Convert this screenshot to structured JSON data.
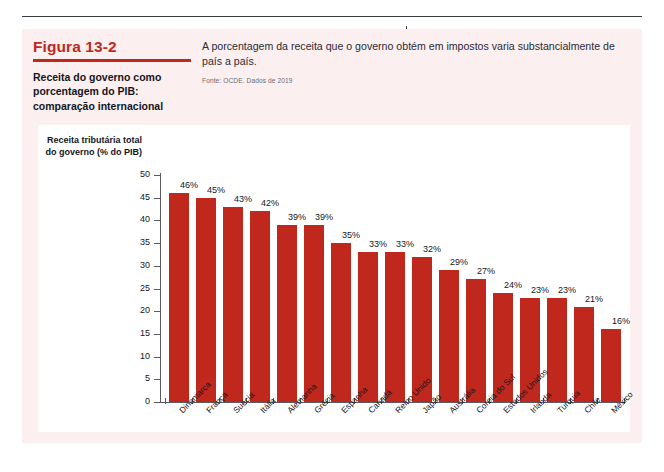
{
  "figure": {
    "number": "Figura 13-2",
    "subtitle": "Receita do governo como porcentagem do PIB: comparação internacional",
    "description": "A porcentagem da receita que o governo obtém em impostos varia substancialmente de país a país.",
    "source": "Fonte: OCDE. Dados de 2019"
  },
  "colors": {
    "bar": "#C0281E",
    "accent": "#C0281E",
    "panel": "#FBEFF0",
    "axis": "#5A5A62",
    "text": "#16161C"
  },
  "chart_data": {
    "type": "bar",
    "title": "Receita do governo como porcentagem do PIB: comparação internacional",
    "xlabel": "",
    "ylabel": "Receita tributária total do governo (% do PIB)",
    "ylim": [
      0,
      50
    ],
    "ytick_step": 5,
    "yticks": [
      50,
      45,
      40,
      35,
      30,
      25,
      20,
      15,
      10,
      5,
      0
    ],
    "grid": false,
    "legend": false,
    "value_suffix": "%",
    "categories": [
      "Dinamarca",
      "França",
      "Suécia",
      "Itália",
      "Alemanha",
      "Grécia",
      "Espanha",
      "Canadá",
      "Reino Unido",
      "Japão",
      "Austrália",
      "Coreia do Sul",
      "Estados Unidos",
      "Irlanda",
      "Turquia",
      "Chile",
      "México"
    ],
    "values": [
      46,
      45,
      43,
      42,
      39,
      39,
      35,
      33,
      33,
      32,
      29,
      27,
      24,
      23,
      23,
      21,
      16
    ],
    "value_labels": [
      "46%",
      "45%",
      "43%",
      "42%",
      "39%",
      "39%",
      "35%",
      "33%",
      "33%",
      "32%",
      "29%",
      "27%",
      "24%",
      "23%",
      "23%",
      "21%",
      "16%"
    ]
  }
}
